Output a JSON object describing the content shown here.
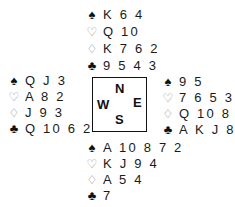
{
  "diagram": {
    "type": "bridge-deal",
    "compass": {
      "north": "N",
      "south": "S",
      "east": "E",
      "west": "W"
    },
    "suit_icons": {
      "spades": {
        "glyph": "♠",
        "name": "spade-icon",
        "style": "filled"
      },
      "hearts": {
        "glyph": "♡",
        "name": "heart-icon",
        "style": "outline"
      },
      "diamonds": {
        "glyph": "♢",
        "name": "diamond-icon",
        "style": "outline"
      },
      "clubs": {
        "glyph": "♣",
        "name": "club-icon",
        "style": "filled"
      }
    },
    "hands": {
      "north": {
        "spades": "K 6 4",
        "hearts": "Q 10",
        "diamonds": "K 7 6 2",
        "clubs": "9 5 4 3"
      },
      "west": {
        "spades": "Q J 3",
        "hearts": "A 8 2",
        "diamonds": "J 9 3",
        "clubs": "Q 10 6 2"
      },
      "east": {
        "spades": "9 5",
        "hearts": "7 6 5 3",
        "diamonds": "Q 10 8",
        "clubs": "A K J 8"
      },
      "south": {
        "spades": "A 10 8 7 2",
        "hearts": "K J 9 4",
        "diamonds": "A 5 4",
        "clubs": "7"
      }
    }
  }
}
